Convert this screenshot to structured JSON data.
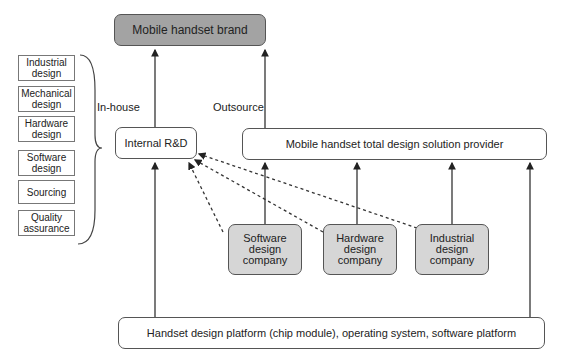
{
  "title_box": "Mobile handset brand",
  "labels": {
    "in_house": "In-house",
    "outsource": "Outsource"
  },
  "internal_rd": "Internal R&D",
  "solution_provider": "Mobile handset total design solution provider",
  "platform": "Handset design platform (chip module), operating system, software platform",
  "companies": [
    {
      "line1": "Software",
      "line2": "design",
      "line3": "company"
    },
    {
      "line1": "Hardware",
      "line2": "design",
      "line3": "company"
    },
    {
      "line1": "Industrial",
      "line2": "design",
      "line3": "company"
    }
  ],
  "functions": [
    {
      "line1": "Industrial",
      "line2": "design"
    },
    {
      "line1": "Mechanical",
      "line2": "design"
    },
    {
      "line1": "Hardware",
      "line2": "design"
    },
    {
      "line1": "Software",
      "line2": "design"
    },
    {
      "line1": "Sourcing",
      "line2": ""
    },
    {
      "line1": "Quality",
      "line2": "assurance"
    }
  ]
}
